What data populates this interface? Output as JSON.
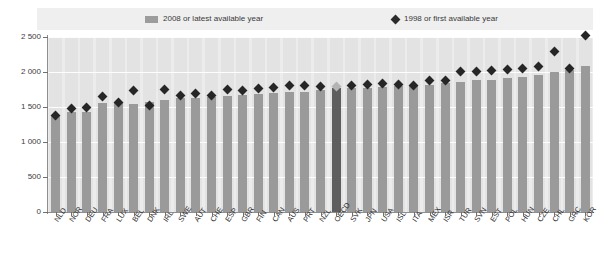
{
  "legend": {
    "bar_series_label": "2008 or latest available year",
    "bar_swatch_icon": "bar-swatch-icon",
    "diamond_series_label": "1998 or first available year",
    "diamond_swatch_icon": "diamond-marker-icon"
  },
  "axis": {
    "y_ticks": [
      "0",
      "500",
      "1 000",
      "1 500",
      "2 000",
      "2 500"
    ]
  },
  "colors": {
    "bar": "#9a9a9a",
    "bar_highlight": "#5e5e5e",
    "diamond": "#262626",
    "diamond_highlight": "#b4b4b4",
    "plot_background": "#ececec",
    "legend_background": "#efefef",
    "axis": "#8e8e8e"
  },
  "chart_data": {
    "type": "bar",
    "title": "",
    "subtitle": "",
    "xlabel": "",
    "ylabel": "",
    "ylim": [
      0,
      2500
    ],
    "ytick_step": 500,
    "grid": true,
    "legend_position": "top",
    "highlight_category": "OECD",
    "categories": [
      "NLD",
      "NOR",
      "DEU",
      "FRA",
      "LUX",
      "BEL",
      "DNK",
      "IRL",
      "SWE",
      "AUT",
      "CHE",
      "ESP",
      "GBR",
      "FIN",
      "CAN",
      "AUS",
      "PRT",
      "NZL",
      "OECD",
      "SVK",
      "JPN",
      "USA",
      "ISL",
      "ITA",
      "MEX",
      "ISR",
      "TUR",
      "SVN",
      "EST",
      "POL",
      "HUN",
      "CZE",
      "CHL",
      "GRC",
      "KOR"
    ],
    "series": [
      {
        "name": "2008 or latest available year",
        "type": "bar",
        "values": [
          1390,
          1430,
          1430,
          1555,
          1555,
          1545,
          1565,
          1600,
          1625,
          1635,
          1640,
          1655,
          1665,
          1680,
          1700,
          1715,
          1720,
          1750,
          1765,
          1775,
          1775,
          1790,
          1800,
          1805,
          1820,
          1840,
          1860,
          1880,
          1890,
          1910,
          1930,
          1955,
          2000,
          2035,
          2090
        ]
      },
      {
        "name": "1998 or first available year",
        "type": "scatter",
        "values": [
          1375,
          1480,
          1500,
          1650,
          1565,
          1740,
          1525,
          1755,
          1660,
          1690,
          1665,
          1745,
          1730,
          1765,
          1775,
          1805,
          1805,
          1790,
          1790,
          1805,
          1820,
          1840,
          1820,
          1810,
          1880,
          1880,
          2010,
          2010,
          2025,
          2030,
          2045,
          2075,
          2295,
          2050,
          2520
        ]
      }
    ]
  }
}
